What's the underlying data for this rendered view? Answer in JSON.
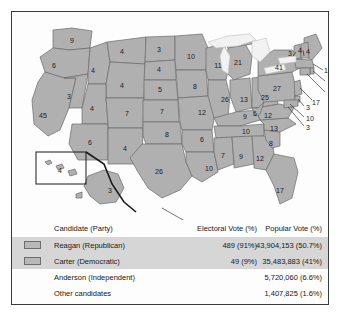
{
  "map": {
    "note": "Electoral votes by state, 1980",
    "states": [
      {
        "abbr": "WA",
        "ev": "9",
        "x": 60,
        "y": 28
      },
      {
        "abbr": "OR",
        "ev": "6",
        "x": 42,
        "y": 53
      },
      {
        "abbr": "CA",
        "ev": "45",
        "x": 31,
        "y": 103
      },
      {
        "abbr": "NV",
        "ev": "3",
        "x": 57,
        "y": 84
      },
      {
        "abbr": "ID",
        "ev": "4",
        "x": 81,
        "y": 58
      },
      {
        "abbr": "MT",
        "ev": "4",
        "x": 110,
        "y": 39
      },
      {
        "abbr": "WY",
        "ev": "4",
        "x": 110,
        "y": 73
      },
      {
        "abbr": "UT",
        "ev": "4",
        "x": 80,
        "y": 96
      },
      {
        "abbr": "AZ",
        "ev": "6",
        "x": 78,
        "y": 130
      },
      {
        "abbr": "CO",
        "ev": "7",
        "x": 115,
        "y": 101
      },
      {
        "abbr": "NM",
        "ev": "4",
        "x": 113,
        "y": 136
      },
      {
        "abbr": "ND",
        "ev": "3",
        "x": 147,
        "y": 37
      },
      {
        "abbr": "SD",
        "ev": "4",
        "x": 147,
        "y": 57
      },
      {
        "abbr": "NE",
        "ev": "5",
        "x": 148,
        "y": 77
      },
      {
        "abbr": "KS",
        "ev": "7",
        "x": 150,
        "y": 99
      },
      {
        "abbr": "OK",
        "ev": "8",
        "x": 155,
        "y": 122
      },
      {
        "abbr": "TX",
        "ev": "26",
        "x": 147,
        "y": 159
      },
      {
        "abbr": "MN",
        "ev": "10",
        "x": 179,
        "y": 44
      },
      {
        "abbr": "IA",
        "ev": "8",
        "x": 183,
        "y": 74
      },
      {
        "abbr": "MO",
        "ev": "12",
        "x": 190,
        "y": 100
      },
      {
        "abbr": "AR",
        "ev": "6",
        "x": 190,
        "y": 127
      },
      {
        "abbr": "LA",
        "ev": "10",
        "x": 197,
        "y": 156
      },
      {
        "abbr": "WI",
        "ev": "11",
        "x": 206,
        "y": 53
      },
      {
        "abbr": "MI",
        "ev": "21",
        "x": 226,
        "y": 50
      },
      {
        "abbr": "IL",
        "ev": "26",
        "x": 213,
        "y": 87
      },
      {
        "abbr": "IN",
        "ev": "13",
        "x": 232,
        "y": 87
      },
      {
        "abbr": "OH",
        "ev": "25",
        "x": 253,
        "y": 85
      },
      {
        "abbr": "KY",
        "ev": "9",
        "x": 233,
        "y": 104
      },
      {
        "abbr": "TN",
        "ev": "10",
        "x": 234,
        "y": 119
      },
      {
        "abbr": "MS",
        "ev": "7",
        "x": 211,
        "y": 143
      },
      {
        "abbr": "AL",
        "ev": "9",
        "x": 229,
        "y": 144
      },
      {
        "abbr": "GA",
        "ev": "12",
        "x": 248,
        "y": 146
      },
      {
        "abbr": "FL",
        "ev": "17",
        "x": 268,
        "y": 178
      },
      {
        "abbr": "SC",
        "ev": "8",
        "x": 259,
        "y": 131
      },
      {
        "abbr": "NC",
        "ev": "13",
        "x": 262,
        "y": 116
      },
      {
        "abbr": "VA",
        "ev": "12",
        "x": 256,
        "y": 103
      },
      {
        "abbr": "WV",
        "ev": "6",
        "x": 243,
        "y": 101
      },
      {
        "abbr": "PA",
        "ev": "27",
        "x": 265,
        "y": 76
      },
      {
        "abbr": "NY",
        "ev": "41",
        "x": 267,
        "y": 55
      },
      {
        "abbr": "ME",
        "ev": "4",
        "x": 296,
        "y": 39
      },
      {
        "abbr": "VT",
        "ev": "3",
        "x": 278,
        "y": 41
      },
      {
        "abbr": "NH",
        "ev": "4",
        "x": 288,
        "y": 38
      }
    ],
    "callouts": [
      {
        "abbr": "MA",
        "ev": "14",
        "x": 316,
        "y": 58
      },
      {
        "abbr": "RI",
        "ev": "4",
        "x": 318,
        "y": 70
      },
      {
        "abbr": "CT",
        "ev": "8",
        "x": 318,
        "y": 81
      },
      {
        "abbr": "NJ",
        "ev": "17",
        "x": 304,
        "y": 90
      },
      {
        "abbr": "DE",
        "ev": "3",
        "x": 296,
        "y": 95
      },
      {
        "abbr": "MD",
        "ev": "10",
        "x": 298,
        "y": 106
      },
      {
        "abbr": "DC",
        "ev": "3",
        "x": 296,
        "y": 115
      }
    ],
    "insets": [
      {
        "abbr": "HI",
        "ev": "4",
        "x": 48,
        "y": 158
      },
      {
        "abbr": "AK",
        "ev": "3",
        "x": 98,
        "y": 178
      }
    ]
  },
  "table": {
    "headers": {
      "candidate": "Candidate (Party)",
      "electoral": "Electoral Vote (%)",
      "popular": "Popular Vote (%)"
    },
    "rows": [
      {
        "swatch": true,
        "shaded": true,
        "candidate": "Reagan (Republican)",
        "electoral": "489 (91%)",
        "popular": "43,904,153 (50.7%)"
      },
      {
        "swatch": true,
        "shaded": true,
        "candidate": "Carter (Democratic)",
        "electoral": "49 (9%)",
        "popular": "35,483,883 (41%)"
      },
      {
        "swatch": false,
        "shaded": false,
        "candidate": "Anderson (Independent)",
        "electoral": "",
        "popular": "5,720,060 (6.6%)"
      },
      {
        "swatch": false,
        "shaded": false,
        "candidate": "Other candidates",
        "electoral": "",
        "popular": "1,407,825 (1.6%)"
      }
    ]
  },
  "colors": {
    "state_fill": "#b0b0b0",
    "state_stroke": "#6a6a6a",
    "lake_fill": "#f2f2f2",
    "row_shade": "#d6d6d6",
    "frame": "#3a3a3a",
    "text": "#181818"
  }
}
